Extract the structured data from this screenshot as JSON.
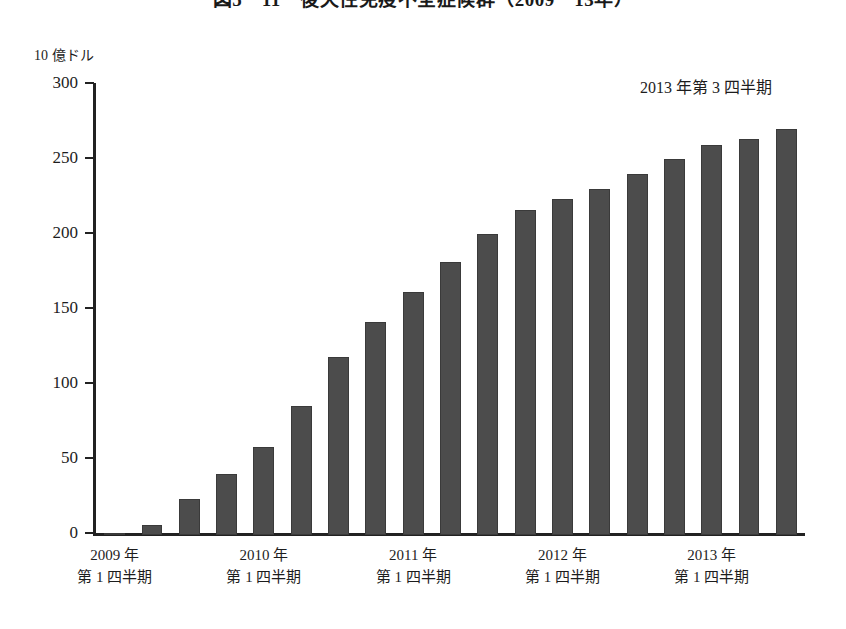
{
  "chart_data": {
    "type": "bar",
    "title": "図5－11　後天性免疫不全症候群（2009－13年）",
    "subtitle": "",
    "xlabel": "",
    "ylabel": "10 億ドル",
    "ylim": [
      0,
      300
    ],
    "yticks": [
      0,
      50,
      100,
      150,
      200,
      250,
      300
    ],
    "ytick_labels": [
      "0",
      "50",
      "100",
      "150",
      "200",
      "250",
      "300"
    ],
    "grid": false,
    "legend": null,
    "bar_color": "#4c4c4c",
    "axis_color": "#222222",
    "annotations": [
      {
        "text": "2013 年第 3 四半期",
        "target": "last-bar",
        "position": "top-right"
      }
    ],
    "categories": [
      "2009 Q1",
      "2009 Q2",
      "2009 Q3",
      "2009 Q4",
      "2010 Q1",
      "2010 Q2",
      "2010 Q3",
      "2010 Q4",
      "2011 Q1",
      "2011 Q2",
      "2011 Q3",
      "2011 Q4",
      "2012 Q1",
      "2012 Q2",
      "2012 Q3",
      "2012 Q4",
      "2013 Q1",
      "2013 Q2",
      "2013 Q3"
    ],
    "values": [
      1,
      7,
      24,
      41,
      59,
      86,
      119,
      142,
      162,
      182,
      201,
      217,
      224,
      231,
      241,
      251,
      260,
      264,
      271
    ],
    "x_group_labels": [
      {
        "year": "2009 年",
        "quarter": "第 1 四半期",
        "at_category_index": 0
      },
      {
        "year": "2010 年",
        "quarter": "第 1 四半期",
        "at_category_index": 4
      },
      {
        "year": "2011 年",
        "quarter": "第 1 四半期",
        "at_category_index": 8
      },
      {
        "year": "2012 年",
        "quarter": "第 1 四半期",
        "at_category_index": 12
      },
      {
        "year": "2013 年",
        "quarter": "第 1 四半期",
        "at_category_index": 16
      }
    ]
  }
}
